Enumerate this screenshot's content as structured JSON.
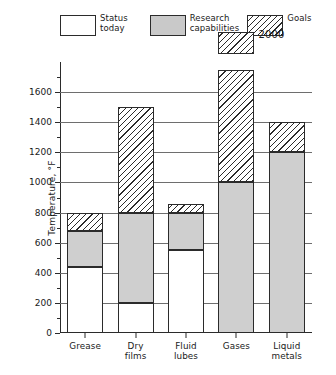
{
  "chart_data": {
    "type": "bar",
    "subtype": "stacked-bar",
    "title": "",
    "xlabel": "",
    "ylabel": "Temperature, °F",
    "ylim": [
      0,
      1800
    ],
    "ytick_step": 200,
    "ytick_labels": [
      "0",
      "200",
      "400",
      "600",
      "800",
      "1000",
      "1200",
      "1400",
      "1600"
    ],
    "ytick_values": [
      0,
      200,
      400,
      600,
      800,
      1000,
      1200,
      1400,
      1600
    ],
    "grid": true,
    "legend_position": "top",
    "categories": [
      "Grease",
      "Dry\nfilms",
      "Fluid\nlubes",
      "Gases",
      "Liquid\nmetals"
    ],
    "series": [
      {
        "name": "Status today",
        "fill": "white",
        "values": [
          440,
          200,
          550,
          0,
          0
        ]
      },
      {
        "name": "Research capabilities",
        "fill": "gray",
        "values": [
          680,
          800,
          800,
          1000,
          1200
        ]
      },
      {
        "name": "Goals",
        "fill": "hatch",
        "values": [
          800,
          1500,
          860,
          1750,
          1400
        ]
      }
    ],
    "detached_blocks": [
      {
        "category": "Gases",
        "from": 1850,
        "to": 2000,
        "fill": "hatch",
        "annotation": "2000"
      }
    ],
    "annotations": [
      {
        "text": "2000",
        "category": "Gases",
        "value": 2000
      }
    ]
  },
  "legend": {
    "items": [
      {
        "label": "Status\ntoday",
        "fill": "white"
      },
      {
        "label": "Research\ncapabilities",
        "fill": "gray"
      },
      {
        "label": "Goals",
        "fill": "hatch"
      }
    ]
  },
  "colors": {
    "axis": "#2b2b2b",
    "grid": "#6e6e6e",
    "status_today": "#ffffff",
    "research_capabilities": "#cfcfcf",
    "goals_hatch": "#2b2b2b",
    "background": "#ffffff"
  }
}
